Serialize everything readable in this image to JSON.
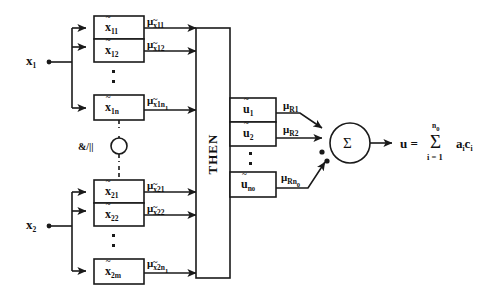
{
  "diagram": {
    "inputs": [
      {
        "label": "x",
        "sub": "1"
      },
      {
        "label": "x",
        "sub": "2"
      }
    ],
    "antecedent_boxes_row1": [
      {
        "symbol": "x",
        "sub": "11"
      },
      {
        "symbol": "x",
        "sub": "12"
      },
      {
        "symbol": "x",
        "sub": "1n"
      }
    ],
    "antecedent_boxes_row2": [
      {
        "symbol": "x",
        "sub": "21"
      },
      {
        "symbol": "x",
        "sub": "22"
      },
      {
        "symbol": "x",
        "sub": "2m"
      }
    ],
    "membership_labels_row1": [
      {
        "mu": "μ",
        "base": "x",
        "sub": "11"
      },
      {
        "mu": "μ",
        "base": "x",
        "sub": "12"
      },
      {
        "mu": "μ",
        "base": "x",
        "sub": "1n",
        "sub2": "1"
      }
    ],
    "membership_labels_row2": [
      {
        "mu": "μ",
        "base": "x",
        "sub": "21"
      },
      {
        "mu": "μ",
        "base": "x",
        "sub": "22"
      },
      {
        "mu": "μ",
        "base": "x",
        "sub": "2n",
        "sub2": "1"
      }
    ],
    "connective": {
      "label": "&/||"
    },
    "then_block": {
      "label": "THEN"
    },
    "consequent_boxes": [
      {
        "symbol": "u",
        "sub": "1"
      },
      {
        "symbol": "u",
        "sub": "2"
      },
      {
        "symbol": "u",
        "sub": "n",
        "sub2": "0"
      }
    ],
    "rule_labels": [
      {
        "mu": "μ",
        "base": "R",
        "sub": "1"
      },
      {
        "mu": "μ",
        "base": "R",
        "sub": "2"
      },
      {
        "mu": "μ",
        "base": "R",
        "sub": "n",
        "sub2": "0"
      }
    ],
    "summation": {
      "symbol": "Σ"
    },
    "output_equation": {
      "lhs": "u =",
      "sigma": "Σ",
      "upper": "n",
      "upper_sub": "0",
      "lower": "i = 1",
      "terms": "a",
      "terms_sub": "i",
      "terms2": "c",
      "terms2_sub": "i"
    },
    "ellipsis": {
      "glyph": "▪"
    },
    "colors": {
      "stroke": "#1a1a1a",
      "background": "#ffffff",
      "text": "#111111"
    }
  }
}
